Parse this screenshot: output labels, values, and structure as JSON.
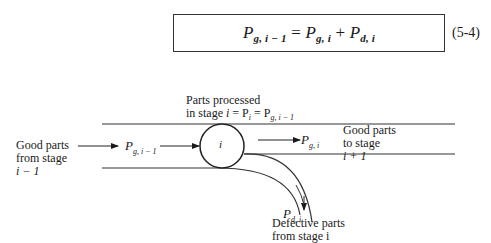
{
  "equation": {
    "lhs_base": "P",
    "lhs_sub": "g, i − 1",
    "equals": " = ",
    "rhs1_base": "P",
    "rhs1_sub": "g, i",
    "plus": " + ",
    "rhs2_base": "P",
    "rhs2_sub": "d, i",
    "number": "(5-4)"
  },
  "diagram": {
    "processed_label_line1": "Parts processed",
    "processed_label_line2_prefix": "in stage ",
    "processed_label_line2_i": "i",
    "processed_label_line2_eq": " = P",
    "processed_label_line2_sub": "i",
    "processed_label_line2_eq2": " = P",
    "processed_label_line2_sub2": "g, i − 1",
    "input_label": [
      "Good parts",
      "from stage",
      "i − 1"
    ],
    "input_symbol_base": "P",
    "input_symbol_sub": "g, i − 1",
    "stage_label": "i",
    "output_symbol_base": "P",
    "output_symbol_sub": "g, i",
    "output_label": [
      "Good parts",
      "to stage",
      "i + 1"
    ],
    "defect_symbol_base": "P",
    "defect_symbol_sub": "d, i",
    "defect_label": [
      "Defective parts",
      "from stage i"
    ]
  }
}
